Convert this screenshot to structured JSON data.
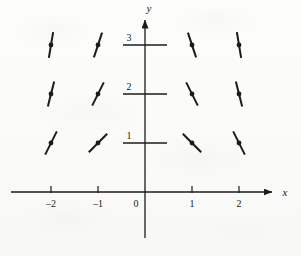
{
  "figure": {
    "kind": "direction-field",
    "caption": "",
    "ink_color": "#1b1b1b",
    "paper_color": "#fbfbfa"
  },
  "axes": {
    "x_axis_label": "x",
    "y_axis_label": "y",
    "origin_label": "0",
    "x_tick_labels": [
      "–2",
      "–1",
      "1",
      "2"
    ],
    "x_tick_values": [
      -2,
      -1,
      1,
      2
    ],
    "y_tick_labels": [
      "1",
      "2",
      "3"
    ],
    "y_tick_values": [
      1,
      2,
      3
    ],
    "xlim": [
      -2.85,
      2.95
    ],
    "ylim": [
      -0.75,
      3.65
    ],
    "grid": false,
    "x_arrow": true,
    "y_arrow": true
  },
  "chart_data": {
    "type": "scatter",
    "title": "",
    "xlabel": "x",
    "ylabel": "y",
    "xlim": [
      -2.85,
      2.95
    ],
    "ylim": [
      -0.75,
      3.65
    ],
    "grid": false,
    "legend": "none",
    "segment_length": 26,
    "points": [
      {
        "x": -2,
        "y": 3,
        "slope": 6.0,
        "angle_deg": 80.5
      },
      {
        "x": -1,
        "y": 3,
        "slope": 3.0,
        "angle_deg": 71.6
      },
      {
        "x": 1,
        "y": 3,
        "slope": -3.0,
        "angle_deg": -71.6
      },
      {
        "x": 2,
        "y": 3,
        "slope": -6.0,
        "angle_deg": -80.5
      },
      {
        "x": -2,
        "y": 2,
        "slope": 4.0,
        "angle_deg": 76.0
      },
      {
        "x": -1,
        "y": 2,
        "slope": 2.0,
        "angle_deg": 63.4
      },
      {
        "x": 1,
        "y": 2,
        "slope": -2.0,
        "angle_deg": -63.4
      },
      {
        "x": 2,
        "y": 2,
        "slope": -4.0,
        "angle_deg": -76.0
      },
      {
        "x": -2,
        "y": 1,
        "slope": 2.0,
        "angle_deg": 63.4
      },
      {
        "x": -1,
        "y": 1,
        "slope": 1.0,
        "angle_deg": 45.0
      },
      {
        "x": 1,
        "y": 1,
        "slope": -1.0,
        "angle_deg": -45.0
      },
      {
        "x": 2,
        "y": 1,
        "slope": -2.0,
        "angle_deg": -63.4
      }
    ]
  },
  "geometry": {
    "origin_px": {
      "x": 145,
      "y": 192
    },
    "unit_px": {
      "x": 47,
      "y": 49
    },
    "y_tick_half_width": 22,
    "x_tick_height": 6
  }
}
